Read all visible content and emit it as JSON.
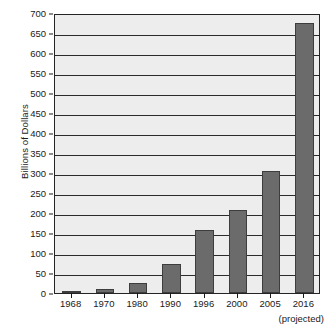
{
  "chart_data": {
    "type": "bar",
    "title": "",
    "subtitle": "",
    "xlabel": "",
    "ylabel": "Billions of Dollars",
    "categories": [
      "1968",
      "1970",
      "1980",
      "1990",
      "1996",
      "2000",
      "2005",
      "2016"
    ],
    "values": [
      3,
      9,
      25,
      72,
      158,
      208,
      306,
      675
    ],
    "ylim": [
      0,
      700
    ],
    "ytick_step": 50,
    "yticks": [
      "0",
      "50",
      "100",
      "150",
      "200",
      "250",
      "300",
      "350",
      "400",
      "450",
      "500",
      "550",
      "600",
      "650",
      "700"
    ],
    "grid": true,
    "legend": "none",
    "annotations": [
      "(projected)"
    ],
    "bar_color": "#6b6b6b",
    "bar_border_color": "#3d3d3d",
    "plot_background": "#ededed",
    "axis_color": "#242424"
  },
  "notes": {
    "projected_label": "(projected)"
  }
}
